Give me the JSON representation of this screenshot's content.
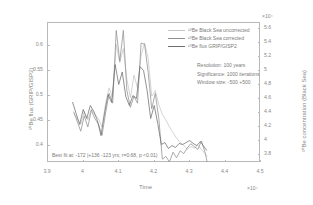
{
  "chart_data": {
    "type": "line",
    "title": "",
    "xlabel": "Time",
    "x_exponent": "×10⁴",
    "ylabel_left": "¹⁰Be flux (GRIP/GISP2)",
    "ylabel_right": "¹⁰Be concentration (Black Sea)",
    "y_right_exponent": "×10⁴",
    "xlim": [
      3.9,
      4.5
    ],
    "xticks": [
      "3.9",
      "4",
      "4.1",
      "4.2",
      "4.3",
      "4.4",
      "4.5"
    ],
    "xtick_values": [
      3.9,
      4.0,
      4.1,
      4.2,
      4.3,
      4.4,
      4.5
    ],
    "ylim_left": [
      0.365,
      0.645
    ],
    "yticks_left": [
      "0.4",
      "0.45",
      "0.5",
      "0.55",
      "0.6"
    ],
    "ytick_values_left": [
      0.4,
      0.45,
      0.5,
      0.55,
      0.6
    ],
    "ylim_right": [
      3.68,
      5.68
    ],
    "yticks_right": [
      "3.8",
      "4",
      "4.2",
      "4.4",
      "4.6",
      "4.8",
      "5",
      "5.2",
      "5.4",
      "5.6"
    ],
    "ytick_values_right": [
      3.8,
      4.0,
      4.2,
      4.4,
      4.6,
      4.8,
      5.0,
      5.2,
      5.4,
      5.6
    ],
    "grid": false,
    "legend_position": "upper-right",
    "series": [
      {
        "name": "¹⁰Be Black Sea uncorrected",
        "color": "#c6c6c6",
        "axis": "right",
        "x": [
          3.975,
          3.985,
          3.995,
          4.005,
          4.015,
          4.025,
          4.035,
          4.045,
          4.055,
          4.065,
          4.075,
          4.085,
          4.095,
          4.105,
          4.115,
          4.125,
          4.135,
          4.145,
          4.155,
          4.165,
          4.175,
          4.185,
          4.195,
          4.205,
          4.215,
          4.225,
          4.235,
          4.245,
          4.255,
          4.265,
          4.275,
          4.285,
          4.295,
          4.305,
          4.315,
          4.325,
          4.335,
          4.345,
          4.352
        ],
        "values": [
          4.38,
          4.3,
          4.22,
          4.4,
          4.28,
          4.44,
          4.36,
          4.3,
          4.18,
          4.52,
          4.74,
          4.6,
          5.36,
          5.1,
          5.3,
          4.86,
          4.6,
          4.92,
          4.74,
          5.2,
          5.38,
          5.16,
          4.62,
          4.7,
          4.5,
          4.36,
          4.28,
          4.18,
          4.1,
          4.02,
          3.96,
          3.92,
          3.86,
          3.9,
          3.88,
          3.92,
          3.86,
          3.8,
          3.76
        ]
      },
      {
        "name": "¹⁰Be Black Sea corrected",
        "color": "#8f8f8f",
        "axis": "right",
        "x": [
          3.975,
          3.985,
          3.995,
          4.005,
          4.015,
          4.025,
          4.035,
          4.045,
          4.055,
          4.065,
          4.075,
          4.085,
          4.095,
          4.105,
          4.115,
          4.125,
          4.135,
          4.145,
          4.155,
          4.165,
          4.175,
          4.185,
          4.195,
          4.205,
          4.215,
          4.225,
          4.235,
          4.245,
          4.255,
          4.265,
          4.275,
          4.285,
          4.295,
          4.305,
          4.315,
          4.325,
          4.335,
          4.345,
          4.352
        ],
        "values": [
          4.4,
          4.26,
          4.12,
          4.34,
          4.18,
          4.42,
          4.3,
          4.22,
          4.06,
          4.38,
          4.66,
          4.52,
          5.56,
          5.12,
          5.56,
          4.7,
          4.46,
          4.62,
          4.52,
          5.38,
          5.36,
          4.96,
          4.44,
          4.66,
          4.3,
          3.72,
          3.76,
          3.68,
          3.82,
          3.74,
          3.84,
          3.8,
          3.88,
          3.94,
          3.9,
          3.86,
          3.98,
          3.82,
          3.66
        ]
      },
      {
        "name": "¹⁰Be flux GRIP/GISP2",
        "color": "#6e6e6e",
        "axis": "left",
        "x": [
          3.972,
          3.982,
          3.992,
          4.002,
          4.012,
          4.022,
          4.032,
          4.042,
          4.052,
          4.062,
          4.072,
          4.082,
          4.092,
          4.102,
          4.112,
          4.122,
          4.132,
          4.142,
          4.152,
          4.162,
          4.172,
          4.182,
          4.192,
          4.202,
          4.212,
          4.222,
          4.232,
          4.242,
          4.252,
          4.262,
          4.272,
          4.282,
          4.292,
          4.302,
          4.312,
          4.322,
          4.332,
          4.342,
          4.35
        ],
        "values": [
          0.485,
          0.462,
          0.44,
          0.47,
          0.452,
          0.478,
          0.466,
          0.448,
          0.418,
          0.462,
          0.5,
          0.484,
          0.56,
          0.52,
          0.545,
          0.496,
          0.478,
          0.498,
          0.492,
          0.556,
          0.548,
          0.508,
          0.452,
          0.478,
          0.442,
          0.4,
          0.404,
          0.392,
          0.398,
          0.394,
          0.402,
          0.4,
          0.404,
          0.408,
          0.402,
          0.398,
          0.406,
          0.396,
          0.388
        ]
      }
    ],
    "annotations": {
      "resolution": "Resolution: 100 years",
      "significance": "Significance: 1000 iterations",
      "window_size": "Window size: -500 +500",
      "best_fit": "Best fit at: -172 |+136 -123 yrs; r=0.68, p <0.01)"
    }
  }
}
